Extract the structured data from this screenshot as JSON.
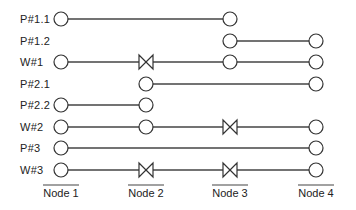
{
  "diagram": {
    "columns": [
      {
        "id": "n1",
        "label": "Node 1",
        "x": 61
      },
      {
        "id": "n2",
        "label": "Node 2",
        "x": 146
      },
      {
        "id": "n3",
        "label": "Node 3",
        "x": 230
      },
      {
        "id": "n4",
        "label": "Node 4",
        "x": 316
      }
    ],
    "rows": [
      {
        "label": "P#1.1",
        "y": 19,
        "span": [
          0,
          2
        ],
        "markers": [
          "circle",
          null,
          "circle",
          null
        ]
      },
      {
        "label": "P#1.2",
        "y": 41,
        "span": [
          2,
          3
        ],
        "markers": [
          null,
          null,
          "circle",
          "circle"
        ]
      },
      {
        "label": "W#1",
        "y": 62,
        "span": [
          0,
          3
        ],
        "markers": [
          "circle",
          "valve",
          "circle",
          "circle"
        ]
      },
      {
        "label": "P#2.1",
        "y": 84,
        "span": [
          1,
          3
        ],
        "markers": [
          null,
          "circle",
          null,
          "circle"
        ]
      },
      {
        "label": "P#2.2",
        "y": 105,
        "span": [
          0,
          1
        ],
        "markers": [
          "circle",
          "circle",
          null,
          null
        ]
      },
      {
        "label": "W#2",
        "y": 127,
        "span": [
          0,
          3
        ],
        "markers": [
          "circle",
          "circle",
          "valve",
          "circle"
        ]
      },
      {
        "label": "P#3",
        "y": 148,
        "span": [
          0,
          3
        ],
        "markers": [
          "circle",
          null,
          null,
          "circle"
        ]
      },
      {
        "label": "W#3",
        "y": 170,
        "span": [
          0,
          3
        ],
        "markers": [
          "circle",
          "valve",
          "valve",
          "circle"
        ]
      }
    ],
    "colors": {
      "line": "#444444",
      "marker_stroke": "#333333",
      "text": "#222222",
      "background": "#ffffff"
    }
  }
}
